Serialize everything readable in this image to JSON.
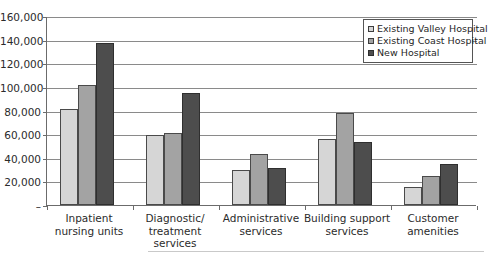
{
  "chart_data": {
    "type": "bar",
    "title": "",
    "xlabel": "",
    "ylabel": "",
    "ylim": [
      0,
      160000
    ],
    "grid": true,
    "legend_position": "top-right",
    "categories": [
      "Inpatient\nnursing units",
      "Diagnostic/\ntreatment\nservices",
      "Administrative\nservices",
      "Building support\nservices",
      "Customer\namenities"
    ],
    "category_lines": [
      [
        "Inpatient",
        "nursing units"
      ],
      [
        "Diagnostic/",
        "treatment",
        "services"
      ],
      [
        "Administrative",
        "services"
      ],
      [
        "Building support",
        "services"
      ],
      [
        "Customer",
        "amenities"
      ]
    ],
    "series": [
      {
        "name": "Existing Valley Hospital",
        "color": "#d6d6d6",
        "values": [
          81000,
          59000,
          29500,
          56000,
          15000
        ]
      },
      {
        "name": "Existing Coast Hospital",
        "color": "#a3a3a3",
        "values": [
          102000,
          61000,
          43500,
          77500,
          24500
        ]
      },
      {
        "name": "New Hospital",
        "color": "#4d4d4d",
        "values": [
          137000,
          95000,
          31000,
          53500,
          35000
        ]
      }
    ],
    "y_ticks": [
      {
        "value": 160000,
        "label": "160,000"
      },
      {
        "value": 140000,
        "label": "140,000"
      },
      {
        "value": 120000,
        "label": "120,000"
      },
      {
        "value": 100000,
        "label": "100,000"
      },
      {
        "value": 80000,
        "label": "80,000"
      },
      {
        "value": 60000,
        "label": "60,000"
      },
      {
        "value": 40000,
        "label": "40,000"
      },
      {
        "value": 20000,
        "label": "20,000"
      },
      {
        "value": 0,
        "label": "–"
      }
    ]
  },
  "legend": {
    "items": [
      {
        "label": "Existing Valley Hospital",
        "swatch": "legend-swatch-valley"
      },
      {
        "label": "Existing Coast Hospital",
        "swatch": "legend-swatch-coast"
      },
      {
        "label": "New Hospital",
        "swatch": "legend-swatch-new"
      }
    ]
  }
}
